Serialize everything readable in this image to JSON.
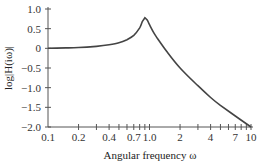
{
  "chart_data": {
    "type": "line",
    "title": "",
    "xlabel": "Angular frequency ω",
    "ylabel": "log|H(iω)|",
    "xscale": "log",
    "xlim": [
      0.1,
      10
    ],
    "ylim": [
      -2.0,
      1.0
    ],
    "grid": false,
    "legend": null,
    "x_ticks": [
      0.1,
      0.2,
      0.4,
      0.7,
      1.0,
      2,
      4,
      7,
      10
    ],
    "x_tick_labels": [
      "0.1",
      "0.2",
      "0.4",
      "0.7",
      "1.0",
      "2",
      "4",
      "7",
      "10"
    ],
    "x_minor_ticks": [
      0.3,
      0.5,
      0.6,
      0.8,
      0.9,
      3,
      5,
      6,
      8,
      9
    ],
    "y_ticks": [
      1.0,
      0.5,
      0,
      -0.5,
      -1.0,
      -1.5,
      -2.0
    ],
    "y_tick_labels": [
      "1.0",
      "0.5",
      "0",
      "−0.5",
      "−1.0",
      "−1.5",
      "−2.0"
    ],
    "series": [
      {
        "name": "log|H(iω)|",
        "color": "#444444",
        "x": [
          0.1,
          0.15,
          0.2,
          0.3,
          0.4,
          0.5,
          0.6,
          0.7,
          0.8,
          0.85,
          0.9,
          0.95,
          1.0,
          1.1,
          1.2,
          1.5,
          2,
          3,
          4,
          5,
          7,
          10
        ],
        "y": [
          0.0,
          0.01,
          0.02,
          0.05,
          0.09,
          0.14,
          0.22,
          0.33,
          0.52,
          0.68,
          0.78,
          0.72,
          0.6,
          0.4,
          0.25,
          -0.1,
          -0.5,
          -0.95,
          -1.25,
          -1.45,
          -1.72,
          -2.0
        ]
      }
    ]
  }
}
